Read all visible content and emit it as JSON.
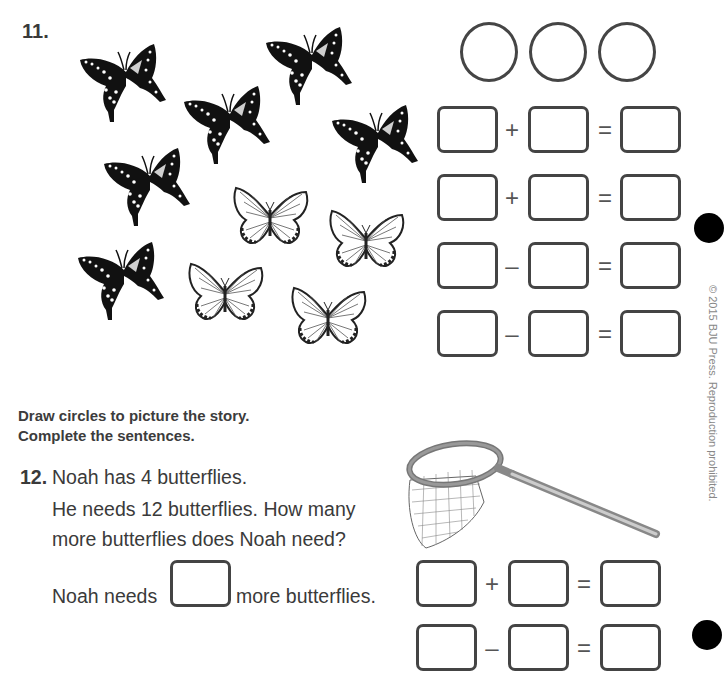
{
  "problem11": {
    "number": "11.",
    "butterflies": {
      "dark_swallowtail_count": 6,
      "light_striped_count": 4
    },
    "circles_count": 3,
    "equations": [
      {
        "operator": "+",
        "equals": "="
      },
      {
        "operator": "+",
        "equals": "="
      },
      {
        "operator": "–",
        "equals": "="
      },
      {
        "operator": "–",
        "equals": "="
      }
    ]
  },
  "instructions": {
    "line1": "Draw circles to picture the story.",
    "line2": "Complete the sentences."
  },
  "problem12": {
    "number": "12.",
    "line1": "Noah has 4 butterflies.",
    "line2": "He needs 12 butterflies. How many",
    "line3": "more butterflies does Noah need?",
    "answer_prefix": "Noah needs",
    "answer_suffix": "more butterflies.",
    "illustration": "butterfly-net",
    "equations": [
      {
        "operator": "+",
        "equals": "="
      },
      {
        "operator": "–",
        "equals": "="
      }
    ]
  },
  "copyright": "© 2015 BJU Press. Reproduction prohibited."
}
